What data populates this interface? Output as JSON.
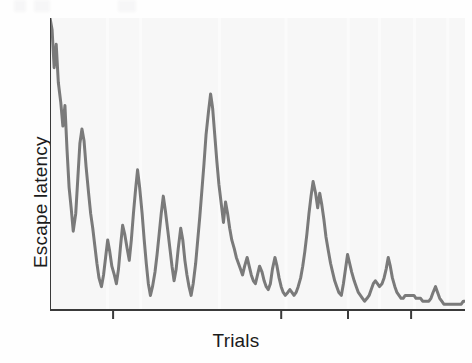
{
  "figure": {
    "background": "#fefefe",
    "plot_background": "#f7f7f7",
    "axis_color": "#3a3a3a",
    "line_color": "#7a7a7a",
    "grid_color": "#fbfbfb"
  },
  "labels": {
    "y_axis": "Escape latency",
    "x_axis": "Trials"
  },
  "chart_data": {
    "type": "line",
    "title": "",
    "xlabel": "Trials",
    "ylabel": "Escape latency",
    "xlim": [
      0,
      100
    ],
    "ylim": [
      0,
      100
    ],
    "grid": true,
    "grid_orientation": "vertical",
    "legend": null,
    "axis_tick_labels": [],
    "x_ticks": [
      0,
      15.2,
      55.7,
      71.8,
      87.0
    ],
    "y_ticks": [],
    "series": [
      {
        "name": "Escape latency",
        "color": "#7a7a7a",
        "line_width": 3,
        "markers": false,
        "x": [
          0.0,
          0.5,
          1.0,
          1.5,
          2.0,
          2.6,
          3.1,
          3.6,
          4.1,
          4.6,
          5.1,
          5.6,
          6.2,
          6.7,
          7.2,
          7.7,
          8.2,
          8.7,
          9.3,
          9.8,
          10.3,
          10.8,
          11.3,
          11.8,
          12.4,
          12.9,
          13.4,
          13.9,
          14.4,
          14.9,
          15.5,
          16.0,
          16.5,
          17.0,
          17.5,
          18.0,
          18.6,
          19.1,
          19.6,
          20.1,
          20.6,
          21.1,
          21.6,
          22.2,
          22.7,
          23.2,
          23.7,
          24.2,
          24.7,
          25.3,
          25.8,
          26.3,
          26.8,
          27.3,
          27.8,
          28.4,
          28.9,
          29.4,
          29.9,
          30.4,
          30.9,
          31.5,
          32.0,
          32.5,
          33.0,
          33.5,
          34.0,
          34.5,
          35.1,
          35.6,
          36.1,
          36.6,
          37.1,
          37.6,
          38.2,
          38.7,
          39.2,
          39.7,
          40.2,
          40.7,
          41.3,
          41.8,
          42.3,
          42.8,
          43.3,
          43.8,
          44.4,
          44.9,
          45.4,
          45.9,
          46.4,
          46.9,
          47.5,
          48.0,
          48.5,
          49.0,
          49.5,
          50.0,
          50.5,
          51.1,
          51.6,
          52.1,
          52.6,
          53.1,
          53.6,
          54.2,
          54.7,
          55.2,
          55.7,
          56.2,
          56.7,
          57.3,
          57.8,
          58.3,
          58.8,
          59.3,
          59.8,
          60.4,
          60.9,
          61.4,
          61.9,
          62.4,
          62.9,
          63.4,
          64.0,
          64.5,
          65.0,
          65.5,
          66.0,
          66.5,
          67.1,
          67.6,
          68.1,
          68.6,
          69.1,
          69.6,
          70.2,
          70.7,
          71.2,
          71.7,
          72.2,
          72.7,
          73.3,
          73.8,
          74.3,
          74.8,
          75.3,
          75.8,
          76.4,
          76.9,
          77.4,
          77.9,
          78.4,
          78.9,
          79.4,
          80.0,
          80.5,
          81.0,
          81.5,
          82.0,
          82.5,
          83.1,
          83.6,
          84.1,
          84.6,
          85.1,
          85.6,
          86.2,
          86.7,
          87.2,
          87.7,
          88.2,
          88.7,
          89.3,
          89.8,
          90.3,
          90.8,
          91.3,
          91.8,
          92.3,
          92.9,
          93.4,
          93.9,
          94.4,
          94.9,
          95.4,
          96.0,
          96.5,
          97.0,
          97.5,
          98.0,
          98.5,
          99.1,
          99.6,
          100.0
        ],
        "y": [
          100.0,
          96.0,
          83.0,
          91.0,
          78.0,
          71.0,
          63.0,
          70.0,
          55.0,
          42.0,
          35.0,
          27.0,
          33.0,
          45.0,
          57.0,
          62.0,
          58.0,
          49.0,
          40.0,
          33.0,
          28.0,
          22.0,
          16.0,
          11.0,
          8.0,
          12.0,
          18.0,
          24.0,
          20.0,
          15.0,
          12.0,
          9.0,
          14.0,
          22.0,
          29.0,
          26.0,
          21.0,
          17.0,
          24.0,
          33.0,
          41.0,
          48.0,
          42.0,
          33.0,
          24.0,
          16.0,
          9.0,
          5.0,
          8.0,
          13.0,
          19.0,
          26.0,
          33.0,
          39.0,
          34.0,
          27.0,
          21.0,
          15.0,
          10.0,
          14.0,
          21.0,
          28.0,
          24.0,
          17.0,
          12.0,
          8.0,
          5.0,
          9.0,
          16.0,
          24.0,
          32.0,
          41.0,
          50.0,
          60.0,
          68.0,
          74.0,
          69.0,
          60.0,
          51.0,
          43.0,
          36.0,
          30.0,
          37.0,
          33.0,
          28.0,
          24.0,
          21.0,
          18.0,
          16.0,
          14.0,
          12.0,
          15.0,
          18.0,
          15.0,
          12.0,
          10.0,
          9.0,
          12.0,
          15.0,
          13.0,
          10.0,
          8.0,
          7.0,
          9.0,
          14.0,
          18.0,
          15.0,
          11.0,
          8.0,
          6.0,
          5.0,
          6.0,
          7.0,
          6.0,
          5.0,
          6.0,
          8.0,
          11.0,
          15.0,
          20.0,
          26.0,
          33.0,
          39.0,
          44.0,
          40.0,
          35.0,
          40.0,
          36.0,
          31.0,
          25.0,
          20.0,
          16.0,
          13.0,
          10.0,
          8.0,
          6.0,
          5.0,
          9.0,
          14.0,
          19.0,
          16.0,
          13.0,
          10.0,
          8.0,
          6.0,
          5.0,
          4.0,
          3.0,
          4.0,
          5.0,
          7.0,
          9.0,
          10.0,
          9.0,
          8.0,
          9.0,
          11.0,
          14.0,
          18.0,
          15.0,
          11.0,
          8.0,
          6.0,
          5.0,
          4.0,
          4.0,
          5.0,
          5.0,
          5.0,
          5.0,
          5.0,
          4.0,
          4.0,
          4.0,
          3.0,
          3.0,
          3.0,
          3.0,
          4.0,
          6.0,
          8.0,
          6.0,
          4.0,
          3.0,
          2.0,
          2.0,
          2.0,
          2.0,
          2.0,
          2.0,
          2.0,
          2.0,
          2.0,
          3.0,
          3.0
        ]
      }
    ]
  }
}
